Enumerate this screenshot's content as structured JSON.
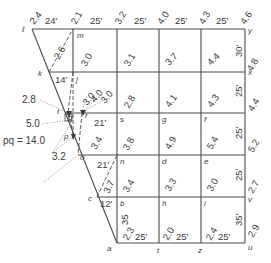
{
  "diagram": {
    "points": {
      "l": "ℓ",
      "m": "m",
      "k": "k",
      "j": "j",
      "t": "t",
      "q": "q",
      "r": "r",
      "p": "p",
      "o": "o",
      "s": "s",
      "g": "g",
      "f": "f",
      "n": "n",
      "d": "d",
      "e": "e",
      "c": "c",
      "b": "b",
      "h": "h",
      "i": "i",
      "a": "a",
      "t2": "t",
      "z": "z",
      "u": "u",
      "v": "v",
      "w": "w",
      "x": "x",
      "y": "y"
    },
    "top_row": {
      "elevations": [
        "2.4",
        "2.1",
        "3.2",
        "4.0",
        "4.3",
        "4.6"
      ],
      "dimensions": [
        "24'",
        "25'",
        "25'",
        "25'",
        "25'"
      ]
    },
    "right_column": {
      "elevations": [
        "4.8",
        "4.4",
        "5.2",
        "2.7",
        "2.9"
      ],
      "dimensions": [
        "30'",
        "25'",
        "25'",
        "25'",
        "35'"
      ]
    },
    "bottom_row": {
      "elevations": [
        "2.3",
        "2.0",
        "2.4"
      ],
      "dimensions": [
        "25'",
        "25'",
        "25'"
      ]
    },
    "grid_elevations": {
      "row1": [
        "3.0",
        "3.1",
        "3.7",
        "4.4"
      ],
      "row2": [
        "2.8",
        "4.1",
        "4.3"
      ],
      "row3": [
        "3.8",
        "4.9",
        "5.4"
      ],
      "row4": [
        "3.4",
        "3.3",
        "3.0"
      ]
    },
    "left_edge": {
      "lk_diag": "2.6",
      "kj_dim": "14'",
      "cluster_elevs": [
        "3.0",
        "4.0",
        "3.0"
      ],
      "t_elev": "2.8",
      "q_elev": "5.0",
      "pq_label": "pq = 14.0",
      "o_elev": "3.2",
      "rs_dim": "21'",
      "op_diag": "3.4",
      "on_dim": "21'",
      "cn_diag": "3.7",
      "cb_dim": "12'",
      "ba_dim": "35"
    }
  }
}
